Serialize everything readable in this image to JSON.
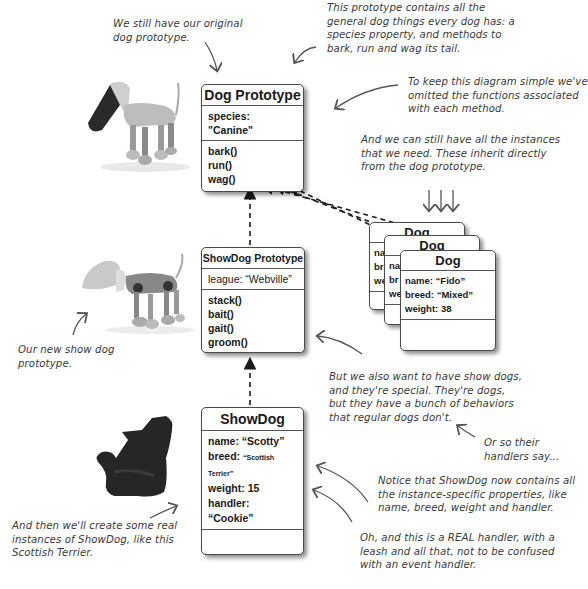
{
  "boxes": {
    "dog_prototype": {
      "title": "Dog Prototype",
      "properties": [
        "species: \"Canine\""
      ],
      "methods": [
        "bark()",
        "run()",
        "wag()"
      ]
    },
    "showdog_prototype": {
      "title": "ShowDog Prototype",
      "properties": [
        "league: “Webville”"
      ],
      "methods": [
        "stack()",
        "bait()",
        "gait()",
        "groom()"
      ]
    },
    "showdog": {
      "title": "ShowDog",
      "properties": [
        "name: “Scotty”",
        "breed: ",
        "weight: 15",
        "handler: “Cookie”"
      ],
      "breed_value": "“Scottish Terrier”",
      "methods": []
    },
    "dog_instances": [
      {
        "title": "Dog",
        "properties": [
          "na",
          "br",
          "we"
        ]
      },
      {
        "title": "Dog",
        "properties": [
          "na",
          "br",
          "we"
        ]
      },
      {
        "title": "Dog",
        "properties": [
          "name: “Fido”",
          "breed: “Mixed”",
          "weight: 38"
        ]
      }
    ]
  },
  "notes": {
    "original_prototype": [
      "We still have our original",
      "dog prototype."
    ],
    "prototype_contents": [
      "This prototype contains all the",
      "general dog things every dog has: a",
      "species property, and methods to",
      "bark, run and wag its tail."
    ],
    "omitted_functions": [
      "To keep this diagram simple we've",
      "omitted the functions associated",
      "with each method."
    ],
    "instances": [
      "And we can still have all the instances",
      "that we need. These inherit directly",
      "from the dog prototype."
    ],
    "new_showdog": [
      "Our new show dog",
      "prototype."
    ],
    "show_dogs_special": [
      "But we also want to have show dogs,",
      "and they're special. They're dogs,",
      "but they have a bunch of behaviors",
      "that regular dogs don't."
    ],
    "handlers_say": [
      "Or so their",
      "handlers say..."
    ],
    "instance_specific": [
      "Notice that ShowDog now contains all",
      "the instance-specific properties, like",
      "name, breed, weight and handler."
    ],
    "real_handler": [
      "Oh, and this is a REAL handler, with a",
      "leash and all that, not to be confused",
      "with an event handler."
    ],
    "real_instances": [
      "And then we'll create some real",
      "instances of ShowDog, like this",
      "Scottish Terrier."
    ]
  },
  "images": {
    "robot_dog_original": "robot-dog-image",
    "robot_dog_show": "robot-show-dog-image",
    "scottish_terrier": "scottish-terrier-image"
  }
}
